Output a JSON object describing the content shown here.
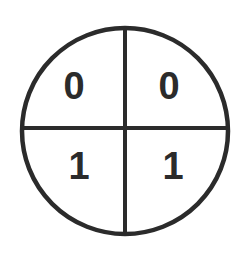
{
  "diagram": {
    "shape_name": "circle-with-crossed-diameters",
    "background_color": "#ffffff",
    "ink_color": "#2b2b2b",
    "geometry": {
      "canvas_width": 249,
      "canvas_height": 253,
      "center_x": 125,
      "center_y": 131,
      "radius": 103,
      "circle_stroke_width": 4.5,
      "divider_stroke_width": 4,
      "vertical_divider_x": 125,
      "horizontal_divider_y": 128
    },
    "quadrants": [
      {
        "position": "top-left",
        "label": "0",
        "label_x": 74,
        "label_y": 89
      },
      {
        "position": "top-right",
        "label": "0",
        "label_x": 169,
        "label_y": 89
      },
      {
        "position": "bottom-left",
        "label": "1",
        "label_x": 79,
        "label_y": 169
      },
      {
        "position": "bottom-right",
        "label": "1",
        "label_x": 173,
        "label_y": 169
      }
    ]
  }
}
